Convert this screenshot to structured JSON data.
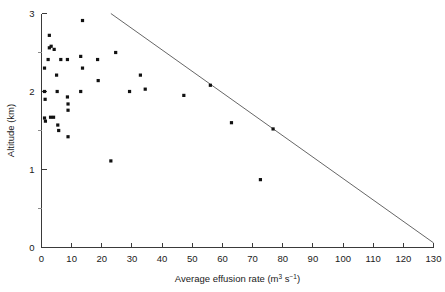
{
  "chart_data": {
    "type": "scatter",
    "title": "",
    "xlabel": "Average effusion rate (m3 s-1)",
    "xlabel_parts": {
      "main": "Average effusion rate (m",
      "sup1": "3",
      "mid": " s",
      "sup2": "−1",
      "tail": ")"
    },
    "ylabel": "Altitude (km)",
    "xlim": [
      0,
      130
    ],
    "ylim": [
      0,
      3
    ],
    "xticks": [
      0,
      10,
      20,
      30,
      40,
      50,
      60,
      70,
      80,
      90,
      100,
      110,
      120,
      130
    ],
    "xticklabels": [
      "0",
      "10",
      "20",
      "30",
      "40",
      "50",
      "60",
      "70",
      "80",
      "90",
      "100",
      "110",
      "120",
      "130"
    ],
    "yticks": [
      0,
      1,
      2,
      3
    ],
    "yticklabels": [
      "0",
      "1",
      "2",
      "3"
    ],
    "yticks_minor": [
      0.5,
      1.5,
      2.5
    ],
    "grid": false,
    "legend": null,
    "marker": "filled-square",
    "point_color": "#111111",
    "line_color": "#555555",
    "axis_color": "#3a3a3a",
    "points": [
      {
        "x": 1.0,
        "y": 2.3
      },
      {
        "x": 1.0,
        "y": 2.0
      },
      {
        "x": 1.2,
        "y": 1.9
      },
      {
        "x": 1.0,
        "y": 1.66
      },
      {
        "x": 1.3,
        "y": 1.62
      },
      {
        "x": 2.6,
        "y": 2.72
      },
      {
        "x": 2.6,
        "y": 2.56
      },
      {
        "x": 3.2,
        "y": 2.58
      },
      {
        "x": 2.2,
        "y": 2.41
      },
      {
        "x": 3.0,
        "y": 1.67
      },
      {
        "x": 4.0,
        "y": 1.67
      },
      {
        "x": 4.2,
        "y": 2.54
      },
      {
        "x": 5.2,
        "y": 2.0
      },
      {
        "x": 5.0,
        "y": 2.21
      },
      {
        "x": 6.4,
        "y": 2.41
      },
      {
        "x": 5.4,
        "y": 1.57
      },
      {
        "x": 5.7,
        "y": 1.5
      },
      {
        "x": 8.6,
        "y": 2.41
      },
      {
        "x": 8.6,
        "y": 1.93
      },
      {
        "x": 8.8,
        "y": 1.84
      },
      {
        "x": 8.8,
        "y": 1.76
      },
      {
        "x": 8.8,
        "y": 1.42
      },
      {
        "x": 13.6,
        "y": 2.91
      },
      {
        "x": 13.0,
        "y": 2.45
      },
      {
        "x": 13.6,
        "y": 2.3
      },
      {
        "x": 13.0,
        "y": 2.0
      },
      {
        "x": 18.6,
        "y": 2.41
      },
      {
        "x": 18.8,
        "y": 2.14
      },
      {
        "x": 23.0,
        "y": 1.11
      },
      {
        "x": 24.6,
        "y": 2.5
      },
      {
        "x": 29.2,
        "y": 2.0
      },
      {
        "x": 32.8,
        "y": 2.21
      },
      {
        "x": 34.4,
        "y": 2.03
      },
      {
        "x": 47.2,
        "y": 1.95
      },
      {
        "x": 56.0,
        "y": 2.08
      },
      {
        "x": 63.0,
        "y": 1.6
      },
      {
        "x": 72.6,
        "y": 0.87
      },
      {
        "x": 76.8,
        "y": 1.52
      }
    ],
    "trend_line": {
      "x_start": 23.0,
      "y_start": 3.0,
      "x_end": 130.0,
      "y_end": 0.06
    }
  }
}
